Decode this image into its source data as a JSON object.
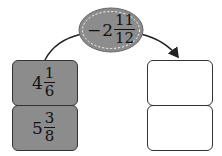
{
  "operator": {
    "sign": "−",
    "whole": "2",
    "numerator": "11",
    "denominator": "12",
    "fill_color": "#8c8c8c"
  },
  "left_column": [
    {
      "whole": "4",
      "numerator": "1",
      "denominator": "6"
    },
    {
      "whole": "5",
      "numerator": "3",
      "denominator": "8"
    }
  ],
  "right_column": [
    {
      "value": ""
    },
    {
      "value": ""
    }
  ]
}
